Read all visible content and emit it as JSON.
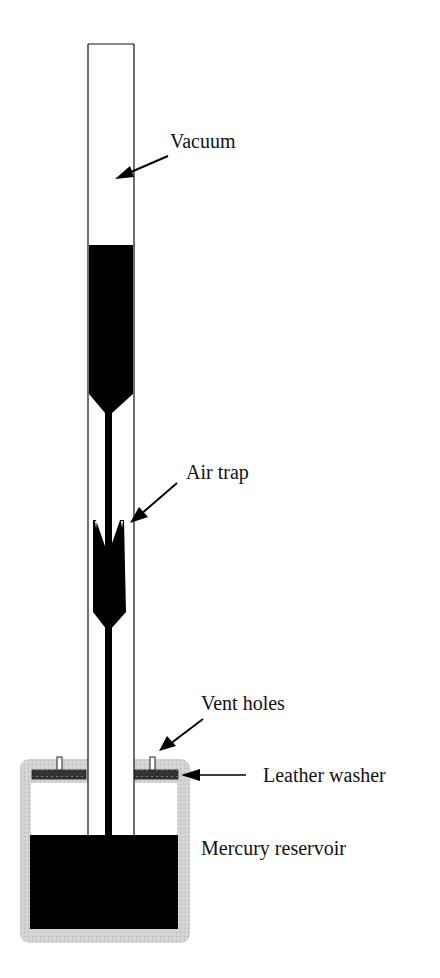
{
  "diagram": {
    "labels": {
      "vacuum": "Vacuum",
      "air_trap": "Air trap",
      "vent_holes": "Vent holes",
      "leather_washer": "Leather washer",
      "mercury_reservoir": "Mercury reservoir"
    },
    "colors": {
      "mercury": "#000000",
      "tube_outline": "#111111",
      "reservoir_case": "#cfcfcf",
      "washer": "#3a3a3a",
      "background": "#ffffff"
    }
  }
}
